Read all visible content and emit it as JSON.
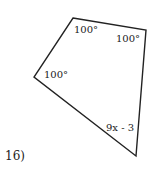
{
  "problem": {
    "number": "16)",
    "shape": "quadrilateral",
    "angles": [
      {
        "id": "top-left",
        "label": "100°"
      },
      {
        "id": "top-right",
        "label": "100°"
      },
      {
        "id": "left",
        "label": "100°"
      },
      {
        "id": "bottom-right",
        "label": "9x - 3"
      }
    ]
  },
  "style": {
    "stroke": "#222222",
    "background": "#ffffff"
  }
}
